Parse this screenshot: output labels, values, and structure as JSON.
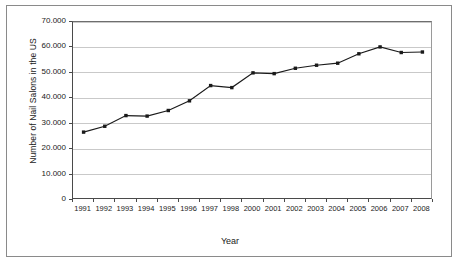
{
  "chart_data": {
    "type": "line",
    "title": "",
    "xlabel": "Year",
    "ylabel": "Number of Nail Salons in the US",
    "categories": [
      "1991",
      "1992",
      "1993",
      "1994",
      "1995",
      "1996",
      "1997",
      "1998",
      "2000",
      "2001",
      "2002",
      "2003",
      "2004",
      "2005",
      "2006",
      "2007",
      "2008"
    ],
    "values": [
      26700,
      29000,
      33200,
      33000,
      35200,
      39000,
      45000,
      44200,
      50000,
      49700,
      51800,
      53000,
      53800,
      57500,
      60200,
      58000,
      58200
    ],
    "series": [
      {
        "name": "Number of Nail Salons in the US",
        "values": [
          26700,
          29000,
          33200,
          33000,
          35200,
          39000,
          45000,
          44200,
          50000,
          49700,
          51800,
          53000,
          53800,
          57500,
          60200,
          58000,
          58200
        ]
      }
    ],
    "ylim": [
      0,
      70000
    ],
    "yticks": [
      0,
      10000,
      20000,
      30000,
      40000,
      50000,
      60000,
      70000
    ],
    "ytick_labels": [
      "0",
      "10.000",
      "20.000",
      "30.000",
      "40.000",
      "50.000",
      "60.000",
      "70.000"
    ],
    "grid": true,
    "legend": false,
    "marker": "square",
    "line_color": "#1a1a1a",
    "marker_color": "#1a1a1a",
    "grid_color": "#c9c9c9",
    "axis_color": "#4a4a4a",
    "background_color": "#ffffff"
  }
}
